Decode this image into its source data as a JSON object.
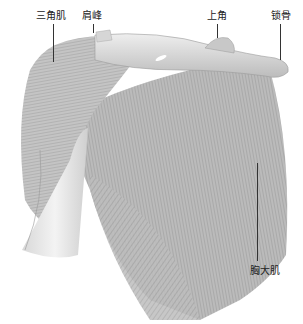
{
  "figure": {
    "labels": [
      {
        "id": "deltoid",
        "text": "三角肌"
      },
      {
        "id": "acromion",
        "text": "肩峰"
      },
      {
        "id": "superior-angle",
        "text": "上角"
      },
      {
        "id": "clavicle",
        "text": "锁骨"
      },
      {
        "id": "pectoralis-major",
        "text": "胸大肌"
      }
    ]
  }
}
